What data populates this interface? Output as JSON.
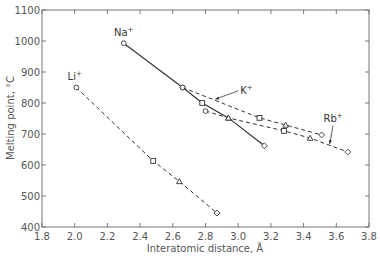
{
  "chart_data": {
    "type": "line",
    "title": "",
    "xlabel": "Interatomic distance, Å",
    "ylabel": "Melting point, °C",
    "xlim": [
      1.8,
      3.8
    ],
    "ylim": [
      400,
      1100
    ],
    "xticks": [
      1.8,
      2.0,
      2.2,
      2.4,
      2.6,
      2.8,
      3.0,
      3.2,
      3.4,
      3.6,
      3.8
    ],
    "xtick_labels": [
      "1.8",
      "2.0",
      "2.2",
      "2.4",
      "2.6",
      "2.8",
      "3.0",
      "3.2",
      "3.4",
      "3.6",
      "3.8"
    ],
    "yticks": [
      400,
      500,
      600,
      700,
      800,
      900,
      1000,
      1100
    ],
    "ytick_labels": [
      "400",
      "500",
      "600",
      "700",
      "800",
      "900",
      "1000",
      "1100"
    ],
    "grid": false,
    "legend": "none (series labeled inline)",
    "series": [
      {
        "name": "Li⁺",
        "label": "Li",
        "line_style": "dashed",
        "points": [
          {
            "x": 2.01,
            "y": 850,
            "marker": "circle"
          },
          {
            "x": 2.48,
            "y": 613,
            "marker": "square"
          },
          {
            "x": 2.64,
            "y": 547,
            "marker": "triangle"
          },
          {
            "x": 2.87,
            "y": 445,
            "marker": "diamond"
          }
        ]
      },
      {
        "name": "Na⁺",
        "label": "Na",
        "line_style": "solid",
        "points": [
          {
            "x": 2.3,
            "y": 993,
            "marker": "circle"
          },
          {
            "x": 2.66,
            "y": 850,
            "marker": "circle"
          },
          {
            "x": 2.78,
            "y": 800,
            "marker": "square"
          },
          {
            "x": 2.94,
            "y": 752,
            "marker": "triangle"
          },
          {
            "x": 3.16,
            "y": 662,
            "marker": "diamond"
          }
        ]
      },
      {
        "name": "K⁺",
        "label": "K",
        "line_style": "dashed",
        "points": [
          {
            "x": 2.66,
            "y": 850,
            "marker": "circle"
          },
          {
            "x": 3.13,
            "y": 752,
            "marker": "square"
          },
          {
            "x": 3.29,
            "y": 729,
            "marker": "triangle"
          },
          {
            "x": 3.51,
            "y": 697,
            "marker": "diamond"
          }
        ]
      },
      {
        "name": "Rb⁺",
        "label": "Rb",
        "line_style": "dashed",
        "points": [
          {
            "x": 2.8,
            "y": 774,
            "marker": "circle"
          },
          {
            "x": 2.94,
            "y": 752,
            "marker": "triangle"
          },
          {
            "x": 3.28,
            "y": 710,
            "marker": "square"
          },
          {
            "x": 3.44,
            "y": 687,
            "marker": "triangle"
          },
          {
            "x": 3.67,
            "y": 642,
            "marker": "diamond"
          }
        ]
      }
    ],
    "annotations": [
      {
        "text": "Li⁺",
        "x": 2.0,
        "y": 875
      },
      {
        "text": "Na⁺",
        "x": 2.3,
        "y": 1015
      },
      {
        "text": "K⁺",
        "x": 3.05,
        "y": 830,
        "arrow_to": {
          "x": 2.86,
          "y": 812
        }
      },
      {
        "text": "Rb⁺",
        "x": 3.58,
        "y": 740,
        "arrow_to": {
          "x": 3.56,
          "y": 668
        }
      }
    ]
  }
}
